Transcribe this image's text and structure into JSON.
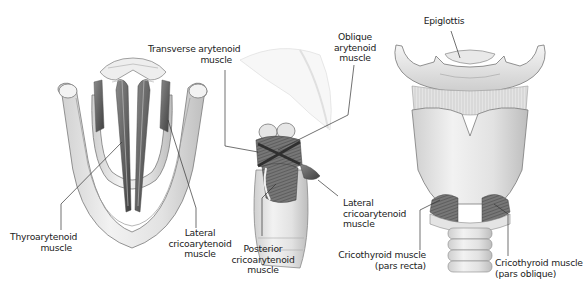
{
  "figure": {
    "panels": [
      {
        "id": "superior-view",
        "description": "Vocal folds from above"
      },
      {
        "id": "posterolateral-view",
        "description": "Arytenoid and cricoarytenoid muscles"
      },
      {
        "id": "anterior-view",
        "description": "Larynx from the front"
      }
    ],
    "colors": {
      "background": "#ffffff",
      "cartilage_fill": "#ebebeb",
      "cartilage_shade": "#c9c9c9",
      "outline": "#7a7a7a",
      "muscle": "#5a5a5a",
      "leader_line": "#333333",
      "label_text": "#222222"
    }
  },
  "labels": {
    "thyroarytenoid": {
      "line1": "Thyroarytenoid",
      "line2": "muscle"
    },
    "lateral_cricoarytenoid_left": {
      "line1": "Lateral",
      "line2": "cricoarytenoid",
      "line3": "muscle"
    },
    "transverse_arytenoid": {
      "line1": "Transverse arytenoid",
      "line2": "muscle"
    },
    "oblique_arytenoid": {
      "line1": "Oblique",
      "line2": "arytenoid",
      "line3": "muscle"
    },
    "lateral_cricoarytenoid_right": {
      "line1": "Lateral",
      "line2": "cricoarytenoid",
      "line3": "muscle"
    },
    "posterior_cricoarytenoid": {
      "line1": "Posterior",
      "line2": "cricoarytenoid",
      "line3": "muscle"
    },
    "epiglottis": {
      "line1": "Epiglottis"
    },
    "cricothyroid_recta": {
      "line1": "Cricothyroid muscle",
      "line2": "(pars recta)"
    },
    "cricothyroid_oblique": {
      "line1": "Cricothyroid muscle",
      "line2": "(pars oblique)"
    }
  }
}
